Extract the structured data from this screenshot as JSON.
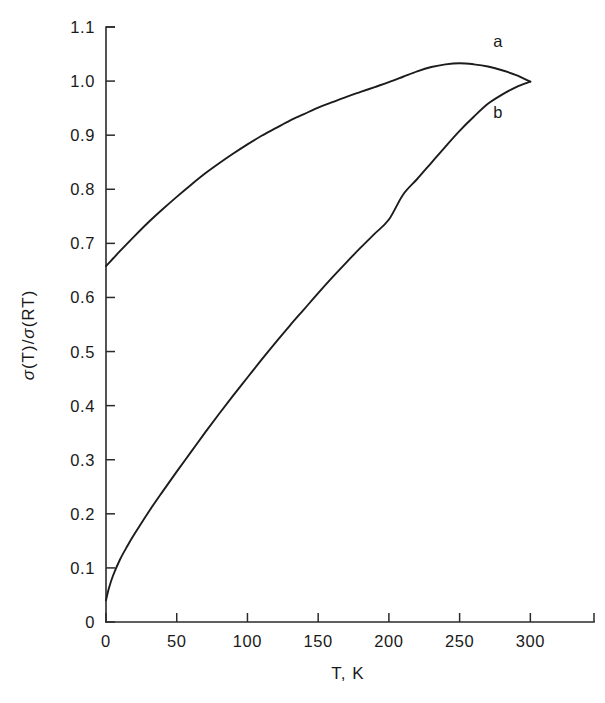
{
  "chart_data": {
    "type": "line",
    "title": "",
    "xlabel": "T, K",
    "ylabel": "σ(T)/σ(RT)",
    "xlim": [
      0,
      345
    ],
    "ylim": [
      0,
      1.1
    ],
    "grid": false,
    "legend_position": "inline-curve-labels",
    "xticks": [
      0,
      50,
      100,
      150,
      200,
      250,
      300
    ],
    "xtick_labels": [
      "0",
      "50",
      "100",
      "150",
      "200",
      "250",
      "300"
    ],
    "yticks": [
      0,
      0.1,
      0.2,
      0.3,
      0.4,
      0.5,
      0.6,
      0.7,
      0.8,
      0.9,
      1.0,
      1.1
    ],
    "ytick_labels": [
      "0",
      "0.1",
      "0.2",
      "0.3",
      "0.4",
      "0.5",
      "0.6",
      "0.7",
      "0.8",
      "0.9",
      "1.0",
      "1.1"
    ],
    "axis_color": "#2a2a2a",
    "curve_color": "#1c1c1c",
    "background_color": "#ffffff",
    "series": [
      {
        "name": "a",
        "label": "a",
        "label_x": 277,
        "label_y": 1.063,
        "x": [
          0,
          5,
          10,
          20,
          30,
          40,
          50,
          60,
          70,
          80,
          90,
          100,
          110,
          120,
          130,
          140,
          150,
          160,
          170,
          180,
          190,
          200,
          210,
          220,
          230,
          240,
          250,
          260,
          270,
          280,
          290,
          300
        ],
        "y": [
          0.658,
          0.672,
          0.686,
          0.713,
          0.739,
          0.763,
          0.786,
          0.808,
          0.829,
          0.848,
          0.866,
          0.883,
          0.899,
          0.913,
          0.927,
          0.939,
          0.951,
          0.961,
          0.971,
          0.98,
          0.989,
          0.998,
          1.008,
          1.018,
          1.026,
          1.031,
          1.033,
          1.031,
          1.027,
          1.02,
          1.011,
          0.999
        ]
      },
      {
        "name": "b",
        "label": "b",
        "label_x": 277,
        "label_y": 0.932,
        "x": [
          0,
          2,
          5,
          10,
          15,
          20,
          30,
          40,
          50,
          60,
          70,
          80,
          90,
          100,
          110,
          120,
          130,
          140,
          150,
          160,
          170,
          180,
          190,
          200,
          210,
          220,
          230,
          240,
          250,
          260,
          270,
          280,
          290,
          300
        ],
        "y": [
          0.04,
          0.062,
          0.086,
          0.116,
          0.14,
          0.162,
          0.203,
          0.241,
          0.278,
          0.314,
          0.35,
          0.385,
          0.419,
          0.452,
          0.485,
          0.517,
          0.548,
          0.578,
          0.608,
          0.637,
          0.665,
          0.692,
          0.718,
          0.744,
          0.79,
          0.819,
          0.849,
          0.879,
          0.908,
          0.934,
          0.958,
          0.975,
          0.989,
          0.999
        ]
      }
    ]
  },
  "figure": {
    "xlabel_text": "T, K",
    "ylabel_sigma1": "σ",
    "ylabel_paren1": "(T)/",
    "ylabel_sigma2": "σ",
    "ylabel_paren2": "(RT)"
  }
}
